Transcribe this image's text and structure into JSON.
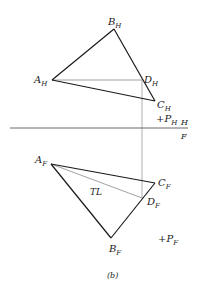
{
  "figure": {
    "caption": "(b)",
    "fold_line": {
      "upper_label": "H",
      "lower_label": "F"
    },
    "top_view": {
      "vertices": [
        {
          "id": "A",
          "main": "A",
          "sub": "H"
        },
        {
          "id": "B",
          "main": "B",
          "sub": "H"
        },
        {
          "id": "C",
          "main": "C",
          "sub": "H"
        },
        {
          "id": "D",
          "main": "D",
          "sub": "H"
        }
      ],
      "point": {
        "symbol": "+",
        "main": "P",
        "sub": "H"
      }
    },
    "front_view": {
      "vertices": [
        {
          "id": "A",
          "main": "A",
          "sub": "F"
        },
        {
          "id": "B",
          "main": "B",
          "sub": "F"
        },
        {
          "id": "C",
          "main": "C",
          "sub": "F"
        },
        {
          "id": "D",
          "main": "D",
          "sub": "F"
        }
      ],
      "true_length_label": "TL",
      "point": {
        "symbol": "+",
        "main": "P",
        "sub": "F"
      }
    }
  },
  "colors": {
    "edge": "#1a1a1a",
    "construction": "#9a9a9a",
    "background": "#ffffff"
  }
}
